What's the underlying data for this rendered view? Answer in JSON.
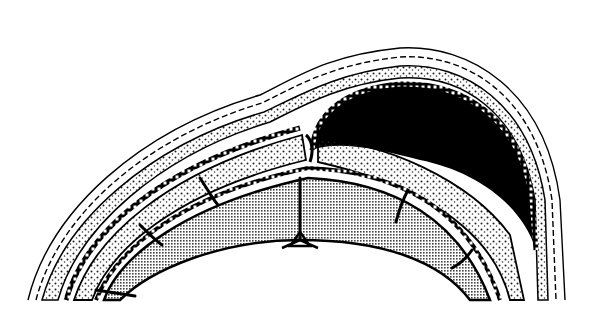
{
  "figure": {
    "width": 593,
    "height": 317,
    "colors": {
      "background": "#ffffff",
      "ink": "#000000",
      "stipple": "#3a3a3a",
      "brain_shade": "#8a8a8a"
    },
    "layers": [
      "scalp-hair",
      "scalp",
      "galea",
      "periosteum",
      "skull-bone",
      "dura",
      "brain-gyri",
      "hematoma"
    ]
  }
}
